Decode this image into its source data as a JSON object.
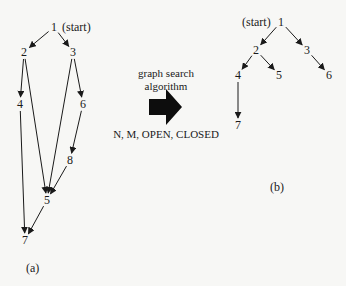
{
  "graph_a": {
    "caption": "(a)",
    "start_label": "(start)",
    "nodes": [
      {
        "id": "1",
        "x": 54,
        "y": 27
      },
      {
        "id": "2",
        "x": 24,
        "y": 52
      },
      {
        "id": "3",
        "x": 73,
        "y": 52
      },
      {
        "id": "4",
        "x": 20,
        "y": 104
      },
      {
        "id": "6",
        "x": 83,
        "y": 104
      },
      {
        "id": "8",
        "x": 70,
        "y": 160
      },
      {
        "id": "5",
        "x": 47,
        "y": 200
      },
      {
        "id": "7",
        "x": 25,
        "y": 240
      }
    ],
    "edges": [
      [
        "1",
        "2"
      ],
      [
        "1",
        "3"
      ],
      [
        "2",
        "4"
      ],
      [
        "2",
        "5"
      ],
      [
        "3",
        "6"
      ],
      [
        "3",
        "5"
      ],
      [
        "4",
        "7"
      ],
      [
        "6",
        "8"
      ],
      [
        "8",
        "5"
      ],
      [
        "5",
        "7"
      ]
    ]
  },
  "graph_b": {
    "caption": "(b)",
    "start_label": "(start)",
    "nodes": [
      {
        "id": "1",
        "x": 281,
        "y": 22
      },
      {
        "id": "2",
        "x": 256,
        "y": 50
      },
      {
        "id": "3",
        "x": 307,
        "y": 50
      },
      {
        "id": "4",
        "x": 238,
        "y": 75
      },
      {
        "id": "5",
        "x": 279,
        "y": 75
      },
      {
        "id": "6",
        "x": 329,
        "y": 75
      },
      {
        "id": "7",
        "x": 238,
        "y": 125
      }
    ],
    "edges": [
      [
        "1",
        "2"
      ],
      [
        "1",
        "3"
      ],
      [
        "2",
        "4"
      ],
      [
        "2",
        "5"
      ],
      [
        "3",
        "6"
      ],
      [
        "4",
        "7"
      ]
    ]
  },
  "transform": {
    "line1": "graph search",
    "line2": "algorithm",
    "params": "N, M, OPEN, CLOSED"
  },
  "colors": {
    "ink": "#1a1a1a",
    "background": "#f7f7f5"
  }
}
